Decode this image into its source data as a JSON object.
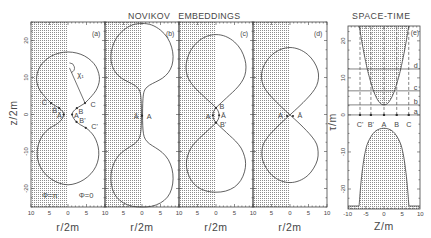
{
  "figure": {
    "title_embeddings": "NOVIKOV   EMBEDDINGS",
    "title_spacetime": "SPACE-TIME"
  },
  "chart_data": [
    {
      "id": "a",
      "type": "line",
      "panel_label": "(a)",
      "panel_label_pos": [
        7.6,
        22.0
      ],
      "xlabel": "r/2m",
      "ylabel": "z/2m",
      "xlim": [
        -10,
        10
      ],
      "ylim": [
        -25,
        25
      ],
      "x_ticks": [
        [
          -10,
          "10"
        ],
        [
          -5,
          "5"
        ],
        [
          0,
          "0"
        ],
        [
          5,
          "5"
        ]
      ],
      "y_ticks": [
        [
          20,
          "20"
        ],
        [
          10,
          "10"
        ],
        [
          0,
          "0"
        ],
        [
          -10,
          "-10"
        ],
        [
          -20,
          "-20"
        ]
      ],
      "ticks": {
        "x_minor": 1,
        "x_major": 5,
        "y_minor": 2.5,
        "y_major": 10
      },
      "grid": false,
      "shaded_regions": [
        [
          [
            -10,
            -25
          ],
          [
            0,
            -25
          ],
          [
            0,
            25
          ],
          [
            -10,
            25
          ]
        ]
      ],
      "curve_half": [
        [
          0,
          16.9
        ],
        [
          2.4,
          16.6
        ],
        [
          4.5,
          15.8
        ],
        [
          6.3,
          14.5
        ],
        [
          7.6,
          12.9
        ],
        [
          8.3,
          11.1
        ],
        [
          8.5,
          9.5
        ],
        [
          8.2,
          7.9
        ],
        [
          7.5,
          6.4
        ],
        [
          6.5,
          5.1
        ],
        [
          5.5,
          4.0
        ],
        [
          4.6,
          3.1
        ],
        [
          3.5,
          2.4
        ],
        [
          2.4,
          1.7
        ],
        [
          1.5,
          0.9
        ],
        [
          1.1,
          0
        ],
        [
          1.5,
          -1.0
        ],
        [
          2.3,
          -2.0
        ],
        [
          3.4,
          -2.8
        ],
        [
          4.8,
          -3.6
        ],
        [
          6.0,
          -4.6
        ],
        [
          7.1,
          -6.0
        ],
        [
          7.9,
          -7.8
        ],
        [
          8.3,
          -9.8
        ],
        [
          8.2,
          -12.0
        ],
        [
          7.5,
          -14.1
        ],
        [
          6.2,
          -16.0
        ],
        [
          4.3,
          -17.6
        ],
        [
          2.2,
          -18.6
        ],
        [
          0,
          -19.0
        ]
      ],
      "markers": [
        {
          "label": "C",
          "x": 4.6,
          "y": 3.1,
          "lx": 6.8,
          "ly": 2.8
        },
        {
          "label": "B",
          "x": 2.4,
          "y": 1.7,
          "lx": 3.5,
          "ly": 0.9
        },
        {
          "label": "A",
          "x": 1.1,
          "y": 0,
          "lx": 2.3,
          "ly": -0.2
        },
        {
          "label": "B'",
          "x": 2.3,
          "y": -2.0,
          "lx": 3.9,
          "ly": -1.6
        },
        {
          "label": "C'",
          "x": 4.8,
          "y": -3.6,
          "lx": 7.2,
          "ly": -3.2
        },
        {
          "label": "C̄",
          "x": -4.6,
          "y": 3.1,
          "lx": -6.4,
          "ly": 3.3
        },
        {
          "label": "B̄",
          "x": -2.4,
          "y": 1.7,
          "lx": -3.6,
          "ly": 1.0
        },
        {
          "label": "Ā",
          "x": -1.1,
          "y": 0,
          "lx": -2.3,
          "ly": -0.3
        }
      ],
      "segments": [
        {
          "from": [
            0.4,
            12.6
          ],
          "to": [
            4.6,
            3.1
          ],
          "arc_radius_px": 5
        }
      ],
      "texts": [
        {
          "text": "χ₁",
          "x": 3.4,
          "y": 10.7
        },
        {
          "text": "Φ=π",
          "x": -4.9,
          "y": -22.0
        },
        {
          "text": "Φ=0",
          "x": 4.9,
          "y": -22.0
        }
      ]
    },
    {
      "id": "b",
      "type": "line",
      "panel_label": "(b)",
      "panel_label_pos": [
        7.6,
        22.0
      ],
      "xlabel": "r/2m",
      "xlim": [
        -10,
        10
      ],
      "ylim": [
        -25,
        25
      ],
      "x_ticks": [
        [
          -10,
          "10"
        ],
        [
          -5,
          "5"
        ],
        [
          0,
          "0"
        ],
        [
          5,
          "5"
        ]
      ],
      "ticks": {
        "x_minor": 1,
        "x_major": 5,
        "y_minor": 2.5,
        "y_major": 10
      },
      "grid": false,
      "shaded_regions": [
        [
          [
            -10,
            -25
          ],
          [
            0,
            -25
          ],
          [
            0,
            25
          ],
          [
            -10,
            25
          ]
        ]
      ],
      "curve_half": [
        [
          0,
          24.6
        ],
        [
          2.6,
          24.2
        ],
        [
          5.0,
          22.8
        ],
        [
          6.9,
          20.7
        ],
        [
          8.0,
          18.2
        ],
        [
          8.4,
          15.7
        ],
        [
          8.1,
          13.3
        ],
        [
          7.1,
          11.3
        ],
        [
          5.5,
          9.8
        ],
        [
          3.7,
          8.8
        ],
        [
          2.0,
          7.9
        ],
        [
          0.9,
          6.9
        ],
        [
          0.4,
          5.5
        ],
        [
          0.2,
          3.0
        ],
        [
          0.15,
          0
        ],
        [
          0.2,
          -3.0
        ],
        [
          0.4,
          -5.2
        ],
        [
          0.9,
          -6.7
        ],
        [
          2.0,
          -7.9
        ],
        [
          3.7,
          -9.0
        ],
        [
          5.5,
          -10.3
        ],
        [
          7.1,
          -12.2
        ],
        [
          8.1,
          -14.7
        ],
        [
          8.4,
          -17.4
        ],
        [
          8.0,
          -20.1
        ],
        [
          6.9,
          -22.3
        ],
        [
          5.0,
          -23.9
        ],
        [
          2.6,
          -24.8
        ],
        [
          0,
          -25.0
        ]
      ],
      "markers": [
        {
          "label": "Ā",
          "x": 0,
          "y": -0.3,
          "lx": -1.6,
          "ly": -0.6
        },
        {
          "label": "A",
          "x": 0,
          "y": -0.3,
          "lx": 1.9,
          "ly": -0.6
        }
      ]
    },
    {
      "id": "c",
      "type": "line",
      "panel_label": "(c)",
      "panel_label_pos": [
        7.6,
        22.0
      ],
      "xlabel": "r/2m",
      "xlim": [
        -10,
        10
      ],
      "ylim": [
        -25,
        25
      ],
      "x_ticks": [
        [
          -10,
          "10"
        ],
        [
          -5,
          "5"
        ],
        [
          0,
          "0"
        ],
        [
          5,
          "5"
        ]
      ],
      "ticks": {
        "x_minor": 1,
        "x_major": 5,
        "y_minor": 2.5,
        "y_major": 10
      },
      "grid": false,
      "shaded_regions": [
        [
          [
            -10,
            -25
          ],
          [
            0,
            -25
          ],
          [
            0,
            25
          ],
          [
            -10,
            25
          ]
        ]
      ],
      "curve_half": [
        [
          0,
          21.6
        ],
        [
          2.6,
          21.1
        ],
        [
          5.0,
          19.6
        ],
        [
          6.8,
          17.4
        ],
        [
          7.8,
          14.9
        ],
        [
          8.1,
          12.8
        ],
        [
          7.8,
          10.6
        ],
        [
          6.8,
          8.6
        ],
        [
          5.3,
          6.8
        ],
        [
          3.6,
          5.2
        ],
        [
          2.1,
          3.8
        ],
        [
          0.8,
          2.6
        ],
        [
          0,
          1.8
        ],
        [
          -0.6,
          0.9
        ],
        [
          -0.85,
          -0.2
        ],
        [
          -0.6,
          -1.3
        ],
        [
          0,
          -2.2
        ],
        [
          0.8,
          -3.0
        ],
        [
          2.1,
          -4.2
        ],
        [
          3.6,
          -5.6
        ],
        [
          5.3,
          -7.2
        ],
        [
          6.8,
          -9.1
        ],
        [
          7.7,
          -11.3
        ],
        [
          8.0,
          -13.3
        ],
        [
          7.7,
          -15.5
        ],
        [
          6.7,
          -17.8
        ],
        [
          5.0,
          -19.6
        ],
        [
          2.6,
          -20.7
        ],
        [
          0,
          -21.0
        ]
      ],
      "markers": [
        {
          "label": "B",
          "x": 0,
          "y": 1.8,
          "lx": 1.6,
          "ly": 2.2
        },
        {
          "label": "A",
          "x": -0.85,
          "y": -0.2,
          "lx": -2.1,
          "ly": -0.5
        },
        {
          "label": "Ā",
          "x": 0.85,
          "y": -0.2,
          "lx": 2.0,
          "ly": -0.3
        },
        {
          "label": "B'",
          "x": 0,
          "y": -2.2,
          "lx": 1.9,
          "ly": -2.8
        }
      ]
    },
    {
      "id": "d",
      "type": "line",
      "panel_label": "(d)",
      "panel_label_pos": [
        7.6,
        22.0
      ],
      "xlabel": "r/2m",
      "xlim": [
        -10,
        10
      ],
      "ylim": [
        -25,
        25
      ],
      "x_ticks": [
        [
          -10,
          "10"
        ],
        [
          -5,
          "5"
        ],
        [
          0,
          "0"
        ],
        [
          5,
          "5"
        ],
        [
          10,
          "10"
        ]
      ],
      "ticks": {
        "x_minor": 1,
        "x_major": 5,
        "y_minor": 2.5,
        "y_major": 10
      },
      "grid": false,
      "shaded_regions": [
        [
          [
            -10,
            -25
          ],
          [
            0,
            -25
          ],
          [
            0,
            25
          ],
          [
            -10,
            25
          ]
        ]
      ],
      "curve_half": [
        [
          0,
          18.1
        ],
        [
          2.5,
          17.6
        ],
        [
          4.8,
          16.2
        ],
        [
          6.5,
          14.2
        ],
        [
          7.5,
          12.0
        ],
        [
          7.7,
          9.9
        ],
        [
          7.2,
          7.8
        ],
        [
          6.0,
          5.9
        ],
        [
          4.4,
          4.1
        ],
        [
          2.7,
          2.4
        ],
        [
          1.2,
          1.0
        ],
        [
          0,
          -0.1
        ],
        [
          -1.2,
          -1.2
        ],
        [
          -2.7,
          -2.6
        ],
        [
          -4.4,
          -4.3
        ],
        [
          -6.0,
          -6.1
        ],
        [
          -7.2,
          -8.0
        ],
        [
          -7.6,
          -10.1
        ],
        [
          -7.4,
          -12.3
        ],
        [
          -6.4,
          -14.5
        ],
        [
          -4.8,
          -16.5
        ],
        [
          -2.5,
          -17.9
        ],
        [
          0,
          -18.4
        ]
      ],
      "markers": [
        {
          "label": "A",
          "x": -0.8,
          "y": -0.4,
          "lx": -2.6,
          "ly": -0.4
        },
        {
          "label": "Ā",
          "x": 0.8,
          "y": -0.4,
          "lx": 2.7,
          "ly": -0.4
        }
      ]
    },
    {
      "id": "e",
      "type": "line",
      "title": "SPACE-TIME",
      "panel_label": "(e)",
      "panel_label_pos": [
        8.5,
        22.2
      ],
      "xlabel": "Z/m",
      "ylabel": "τ/m",
      "xlim": [
        -9.9,
        9.9
      ],
      "ylim": [
        -25.4,
        24.0
      ],
      "x_ticks": [
        [
          -10,
          "-10"
        ],
        [
          -5,
          "-5"
        ],
        [
          0,
          "0"
        ],
        [
          5,
          "5"
        ],
        [
          10,
          "10"
        ]
      ],
      "y_ticks": [
        [
          20,
          "20"
        ],
        [
          10,
          "10"
        ],
        [
          0,
          "0"
        ],
        [
          -10,
          "-10"
        ],
        [
          -20,
          "-20"
        ]
      ],
      "ticks": {
        "x_minor": 1,
        "x_major": 5,
        "y_minor": 2.5,
        "y_major": 10
      },
      "grid": false,
      "upper_curve": [
        [
          -6.8,
          24.0
        ],
        [
          -6.2,
          20.4
        ],
        [
          -5.5,
          16.6
        ],
        [
          -4.6,
          12.4
        ],
        [
          -4.0,
          10.1
        ],
        [
          -3.0,
          6.8
        ],
        [
          -2.0,
          4.5
        ],
        [
          -1.0,
          3.1
        ],
        [
          0,
          2.7
        ],
        [
          1.0,
          3.1
        ],
        [
          2.0,
          4.5
        ],
        [
          3.0,
          6.8
        ],
        [
          4.0,
          10.1
        ],
        [
          4.6,
          12.4
        ],
        [
          5.5,
          16.6
        ],
        [
          6.2,
          20.4
        ],
        [
          6.8,
          24.0
        ]
      ],
      "lower_curve": [
        [
          -6.85,
          -24.6
        ],
        [
          -6.4,
          -19.0
        ],
        [
          -5.9,
          -14.5
        ],
        [
          -5.25,
          -10.4
        ],
        [
          -4.35,
          -7.3
        ],
        [
          -2.5,
          -4.5
        ],
        [
          0,
          -3.6
        ],
        [
          2.5,
          -4.5
        ],
        [
          4.35,
          -7.3
        ],
        [
          5.25,
          -10.4
        ],
        [
          5.9,
          -14.5
        ],
        [
          6.4,
          -19.0
        ],
        [
          6.85,
          -24.6
        ]
      ],
      "lower_base_y": -24.6,
      "hlines": [
        {
          "y": 12.4,
          "label": "d",
          "label_pos": [
            8.7,
            13.3
          ]
        },
        {
          "y": 6.5,
          "label": "c",
          "label_pos": [
            8.7,
            7.4
          ]
        },
        {
          "y": 2.7,
          "label": "b",
          "label_pos": [
            8.7,
            3.6
          ]
        },
        {
          "y": 0,
          "label": "a",
          "label_pos": [
            8.7,
            0.9
          ]
        }
      ],
      "vlines": [
        {
          "x": -6.6,
          "label": "C'"
        },
        {
          "x": -3.6,
          "label": "B'"
        },
        {
          "x": 0,
          "label": "A"
        },
        {
          "x": 3.5,
          "label": "B"
        },
        {
          "x": 6.8,
          "label": "C"
        }
      ],
      "vline_label_y": -2.5
    }
  ]
}
